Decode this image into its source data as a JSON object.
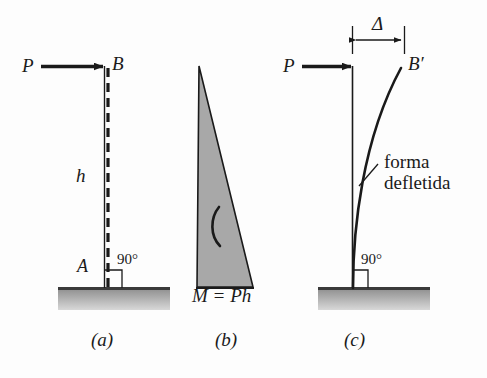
{
  "figure": {
    "background_color": "#fdfdfd",
    "ink_color": "#1a1a1a",
    "ground_fill_top": "#8d8d8d",
    "ground_fill_bottom": "#d4d4d4",
    "moment_fill_color": "#a8a8a8"
  },
  "panels": [
    {
      "key": "a",
      "caption": "(a)",
      "description": "cantilever column with horizontal load P at top",
      "labels": {
        "load": "P",
        "top_node": "B",
        "height": "h",
        "base_node": "A",
        "angle": "90°"
      }
    },
    {
      "key": "b",
      "caption": "(b)",
      "description": "bending moment diagram, triangular distribution",
      "labels": {
        "moment": "M = Ph",
        "moment_arc": "moment-direction-arc"
      }
    },
    {
      "key": "c",
      "caption": "(c)",
      "description": "deflected shape of column under load P",
      "labels": {
        "deflection": "Δ",
        "load": "P",
        "top_node": "B′",
        "annotation_line1": "forma",
        "annotation_line2": "defletida",
        "angle": "90°"
      }
    }
  ]
}
